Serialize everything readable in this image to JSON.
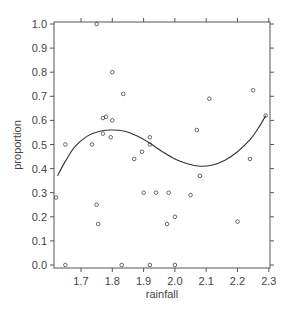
{
  "chart_data": {
    "type": "scatter",
    "title": "",
    "xlabel": "rainfall",
    "ylabel": "proportion",
    "xlim": [
      1.613,
      2.3
    ],
    "ylim": [
      0.0,
      1.0
    ],
    "x_ticks": [
      1.7,
      1.8,
      1.9,
      2.0,
      2.1,
      2.2,
      2.3
    ],
    "x_tick_labels": [
      "1.7",
      "1.8",
      "1.9",
      "2.0",
      "2.1",
      "2.2",
      "2.3"
    ],
    "y_ticks": [
      0.0,
      0.1,
      0.2,
      0.3,
      0.4,
      0.5,
      0.6,
      0.7,
      0.8,
      0.9,
      1.0
    ],
    "y_tick_labels": [
      "0.0",
      "0.1",
      "0.2",
      "0.3",
      "0.4",
      "0.5",
      "0.6",
      "0.7",
      "0.8",
      "0.9",
      "1.0"
    ],
    "grid": false,
    "legend": null,
    "series": [
      {
        "name": "observations",
        "kind": "points",
        "marker": "open-circle",
        "points": [
          [
            1.62,
            0.28
          ],
          [
            1.65,
            0.5
          ],
          [
            1.65,
            0.0
          ],
          [
            1.735,
            0.5
          ],
          [
            1.75,
            1.0
          ],
          [
            1.75,
            0.25
          ],
          [
            1.755,
            0.17
          ],
          [
            1.77,
            0.545
          ],
          [
            1.77,
            0.61
          ],
          [
            1.78,
            0.615
          ],
          [
            1.795,
            0.53
          ],
          [
            1.8,
            0.6
          ],
          [
            1.8,
            0.8
          ],
          [
            1.83,
            0.0
          ],
          [
            1.835,
            0.71
          ],
          [
            1.87,
            0.44
          ],
          [
            1.895,
            0.47
          ],
          [
            1.9,
            0.3
          ],
          [
            1.92,
            0.53
          ],
          [
            1.92,
            0.5
          ],
          [
            1.92,
            0.0
          ],
          [
            1.94,
            0.3
          ],
          [
            1.975,
            0.17
          ],
          [
            1.98,
            0.3
          ],
          [
            2.0,
            0.2
          ],
          [
            2.0,
            0.0
          ],
          [
            2.05,
            0.29
          ],
          [
            2.07,
            0.56
          ],
          [
            2.08,
            0.37
          ],
          [
            2.11,
            0.69
          ],
          [
            2.2,
            0.18
          ],
          [
            2.24,
            0.44
          ],
          [
            2.25,
            0.725
          ],
          [
            2.29,
            0.62
          ]
        ]
      },
      {
        "name": "fitted curve",
        "kind": "line",
        "points": [
          [
            1.625,
            0.37
          ],
          [
            1.65,
            0.43
          ],
          [
            1.68,
            0.49
          ],
          [
            1.72,
            0.535
          ],
          [
            1.76,
            0.555
          ],
          [
            1.8,
            0.56
          ],
          [
            1.84,
            0.555
          ],
          [
            1.88,
            0.535
          ],
          [
            1.92,
            0.505
          ],
          [
            1.96,
            0.47
          ],
          [
            2.0,
            0.44
          ],
          [
            2.04,
            0.42
          ],
          [
            2.08,
            0.41
          ],
          [
            2.12,
            0.415
          ],
          [
            2.16,
            0.435
          ],
          [
            2.2,
            0.47
          ],
          [
            2.24,
            0.52
          ],
          [
            2.27,
            0.575
          ],
          [
            2.29,
            0.62
          ]
        ]
      }
    ]
  },
  "colors": {
    "axis": "#555555",
    "points": "#444444",
    "curve": "#333333",
    "text": "#444444"
  }
}
